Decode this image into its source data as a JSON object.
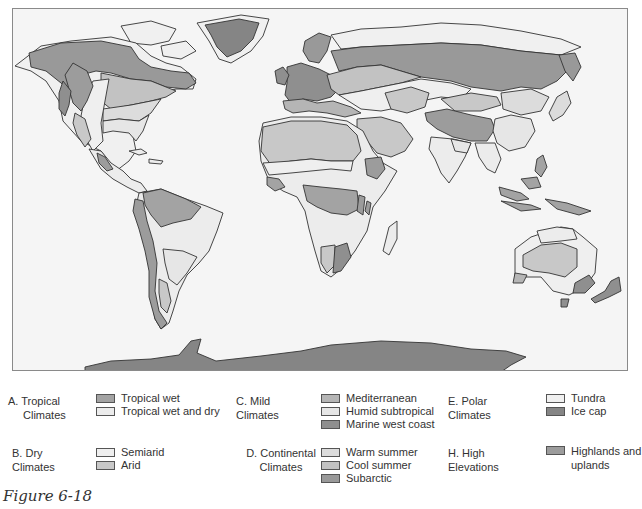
{
  "figure": {
    "caption": "Figure 6-18"
  },
  "colors": {
    "ocean": "#f5f5f5",
    "outline": "#333333",
    "tropical_wet": "#a3a3a3",
    "tropical_wet_and_dry": "#ececec",
    "semiarid": "#efefef",
    "arid": "#c8c8c8",
    "mediterranean": "#b5b5b5",
    "humid_subtropical": "#e6e6e6",
    "marine_west_coast": "#8f8f8f",
    "warm_summer": "#dcdcdc",
    "cool_summer": "#c2c2c2",
    "subarctic": "#999999",
    "tundra": "#f0f0f0",
    "ice_cap": "#858585",
    "highlands": "#9c9c9c"
  },
  "legend": {
    "groups": [
      {
        "id": "A",
        "title_line1": "A. Tropical",
        "title_line2": "Climates",
        "items": [
          {
            "label": "Tropical wet",
            "color": "#a3a3a3"
          },
          {
            "label": "Tropical wet and dry",
            "color": "#ececec"
          }
        ]
      },
      {
        "id": "B",
        "title_line1": "B. Dry Climates",
        "title_line2": "",
        "items": [
          {
            "label": "Semiarid",
            "color": "#efefef"
          },
          {
            "label": "Arid",
            "color": "#c8c8c8"
          }
        ]
      },
      {
        "id": "C",
        "title_line1": "C. Mild Climates",
        "title_line2": "",
        "items": [
          {
            "label": "Mediterranean",
            "color": "#b5b5b5"
          },
          {
            "label": "Humid subtropical",
            "color": "#e6e6e6"
          },
          {
            "label": "Marine west coast",
            "color": "#8f8f8f"
          }
        ]
      },
      {
        "id": "D",
        "title_line1": "D. Continental",
        "title_line2": "Climates",
        "items": [
          {
            "label": "Warm summer",
            "color": "#dcdcdc"
          },
          {
            "label": "Cool summer",
            "color": "#c2c2c2"
          },
          {
            "label": "Subarctic",
            "color": "#999999"
          }
        ]
      },
      {
        "id": "E",
        "title_line1": "E. Polar Climates",
        "title_line2": "",
        "items": [
          {
            "label": "Tundra",
            "color": "#f0f0f0"
          },
          {
            "label": "Ice cap",
            "color": "#858585"
          }
        ]
      },
      {
        "id": "H",
        "title_line1": "H. High Elevations",
        "title_line2": "",
        "items": [
          {
            "label": "Highlands and uplands",
            "color": "#9c9c9c"
          }
        ]
      }
    ]
  }
}
